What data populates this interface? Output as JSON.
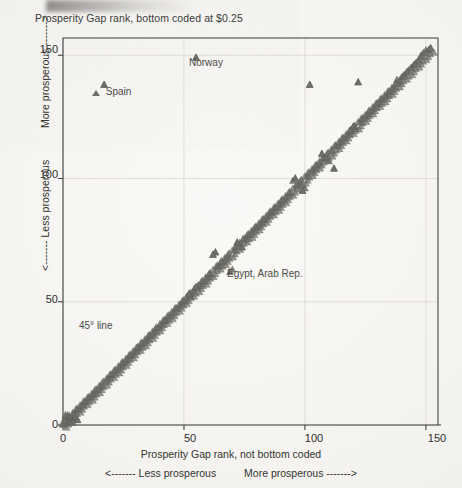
{
  "chart_data": {
    "type": "scatter",
    "title": "Prosperity Gap rank, bottom coded at $0.25",
    "xlabel": "Prosperity Gap rank, not bottom coded",
    "ylabel": "Prosperity Gap rank, bottom coded at $0.25",
    "xlim": [
      0,
      155
    ],
    "ylim": [
      0,
      157
    ],
    "xticks": [
      0,
      50,
      100,
      150
    ],
    "yticks": [
      0,
      50,
      100,
      150
    ],
    "xtick_labels": [
      "0",
      "50",
      "100",
      "150"
    ],
    "ytick_labels": [
      "0",
      "50",
      "100",
      "150"
    ],
    "grid": true,
    "grid_note": "faint light-grey gridlines at each labeled tick",
    "legend": null,
    "marker": "triangle-up",
    "marker_color": "#6e6e6a",
    "reference_line": {
      "name": "45 degree line",
      "label": "45° line",
      "from": [
        0,
        0
      ],
      "to": [
        152,
        152
      ],
      "color": "#8a8a86"
    },
    "x_direction_axis": {
      "left_text": "<------- Less prosperous",
      "right_text": "More prosperous ------->"
    },
    "y_direction_axis": {
      "low_text": "<------- Less prosperous",
      "high_text": "More prosperous ------->"
    },
    "annotations": [
      {
        "name": "norway",
        "label": "Norway",
        "x": 55,
        "y": 149,
        "label_dx": 6,
        "label_dy": -14
      },
      {
        "name": "spain",
        "label": "Spain",
        "x": 17,
        "y": 138,
        "label_dx": 13,
        "label_dy": 0
      },
      {
        "name": "egypt-arab-rep",
        "label": "Egypt, Arab Rep.",
        "x": 55,
        "y": 56,
        "label_dx": 10,
        "label_dy": -20
      },
      {
        "name": "45-degree-line",
        "label": "45° line",
        "x": 22,
        "y": 45,
        "label_dx": 0,
        "label_dy": 0
      }
    ],
    "outliers": [
      {
        "x": 55,
        "y": 149
      },
      {
        "x": 17,
        "y": 138
      },
      {
        "x": 102,
        "y": 138
      },
      {
        "x": 122,
        "y": 139
      },
      {
        "x": 63,
        "y": 70
      },
      {
        "x": 62,
        "y": 69
      },
      {
        "x": 55,
        "y": 56
      },
      {
        "x": 52,
        "y": 53
      },
      {
        "x": 72,
        "y": 74
      },
      {
        "x": 96,
        "y": 100
      },
      {
        "x": 99,
        "y": 95
      },
      {
        "x": 107,
        "y": 110
      },
      {
        "x": 112,
        "y": 104
      },
      {
        "x": 120,
        "y": 121
      },
      {
        "x": 4,
        "y": 1
      },
      {
        "x": 1,
        "y": 4
      },
      {
        "x": 6,
        "y": 2
      }
    ],
    "points": [
      [
        0,
        0
      ],
      [
        1,
        1
      ],
      [
        1,
        3
      ],
      [
        2,
        2
      ],
      [
        2,
        4
      ],
      [
        3,
        1
      ],
      [
        3,
        3
      ],
      [
        4,
        4
      ],
      [
        4,
        2
      ],
      [
        5,
        5
      ],
      [
        5,
        3
      ],
      [
        6,
        6
      ],
      [
        6,
        2
      ],
      [
        7,
        7
      ],
      [
        8,
        8
      ],
      [
        9,
        9
      ],
      [
        10,
        10
      ],
      [
        11,
        11
      ],
      [
        12,
        12
      ],
      [
        13,
        13
      ],
      [
        14,
        14
      ],
      [
        15,
        15
      ],
      [
        16,
        16
      ],
      [
        17,
        138
      ],
      [
        18,
        18
      ],
      [
        19,
        19
      ],
      [
        20,
        20
      ],
      [
        21,
        21
      ],
      [
        22,
        22
      ],
      [
        23,
        23
      ],
      [
        24,
        24
      ],
      [
        25,
        25
      ],
      [
        26,
        26
      ],
      [
        27,
        27
      ],
      [
        28,
        28
      ],
      [
        29,
        29
      ],
      [
        30,
        30
      ],
      [
        31,
        31
      ],
      [
        32,
        32
      ],
      [
        33,
        33
      ],
      [
        34,
        34
      ],
      [
        35,
        35
      ],
      [
        36,
        36
      ],
      [
        37,
        37
      ],
      [
        38,
        38
      ],
      [
        39,
        39
      ],
      [
        40,
        40
      ],
      [
        41,
        41
      ],
      [
        42,
        42
      ],
      [
        43,
        43
      ],
      [
        44,
        44
      ],
      [
        45,
        45
      ],
      [
        46,
        46
      ],
      [
        47,
        47
      ],
      [
        48,
        48
      ],
      [
        49,
        49
      ],
      [
        50,
        50
      ],
      [
        51,
        51
      ],
      [
        52,
        53
      ],
      [
        53,
        52
      ],
      [
        54,
        54
      ],
      [
        55,
        149
      ],
      [
        56,
        56
      ],
      [
        57,
        57
      ],
      [
        58,
        58
      ],
      [
        59,
        59
      ],
      [
        60,
        60
      ],
      [
        61,
        61
      ],
      [
        62,
        69
      ],
      [
        63,
        70
      ],
      [
        64,
        64
      ],
      [
        65,
        65
      ],
      [
        66,
        66
      ],
      [
        67,
        67
      ],
      [
        68,
        68
      ],
      [
        69,
        62
      ],
      [
        70,
        63
      ],
      [
        71,
        71
      ],
      [
        72,
        74
      ],
      [
        73,
        73
      ],
      [
        74,
        72
      ],
      [
        75,
        75
      ],
      [
        76,
        76
      ],
      [
        77,
        77
      ],
      [
        78,
        78
      ],
      [
        79,
        79
      ],
      [
        80,
        80
      ],
      [
        81,
        81
      ],
      [
        82,
        82
      ],
      [
        83,
        83
      ],
      [
        84,
        84
      ],
      [
        85,
        85
      ],
      [
        86,
        86
      ],
      [
        87,
        87
      ],
      [
        88,
        88
      ],
      [
        89,
        89
      ],
      [
        90,
        90
      ],
      [
        91,
        91
      ],
      [
        92,
        92
      ],
      [
        93,
        93
      ],
      [
        94,
        94
      ],
      [
        95,
        99
      ],
      [
        96,
        100
      ],
      [
        97,
        97
      ],
      [
        98,
        98
      ],
      [
        99,
        95
      ],
      [
        100,
        96
      ],
      [
        101,
        101
      ],
      [
        102,
        138
      ],
      [
        103,
        103
      ],
      [
        104,
        104
      ],
      [
        105,
        105
      ],
      [
        106,
        106
      ],
      [
        107,
        110
      ],
      [
        108,
        108
      ],
      [
        109,
        109
      ],
      [
        110,
        107
      ],
      [
        111,
        111
      ],
      [
        112,
        104
      ],
      [
        113,
        113
      ],
      [
        114,
        114
      ],
      [
        115,
        115
      ],
      [
        116,
        116
      ],
      [
        117,
        117
      ],
      [
        118,
        118
      ],
      [
        119,
        119
      ],
      [
        120,
        121
      ],
      [
        121,
        120
      ],
      [
        122,
        139
      ],
      [
        123,
        123
      ],
      [
        124,
        124
      ],
      [
        125,
        125
      ],
      [
        126,
        126
      ],
      [
        127,
        127
      ],
      [
        128,
        128
      ],
      [
        129,
        129
      ],
      [
        130,
        130
      ],
      [
        131,
        131
      ],
      [
        132,
        132
      ],
      [
        133,
        133
      ],
      [
        134,
        134
      ],
      [
        135,
        135
      ],
      [
        136,
        136
      ],
      [
        137,
        137
      ],
      [
        138,
        140
      ],
      [
        139,
        139
      ],
      [
        140,
        141
      ],
      [
        141,
        142
      ],
      [
        142,
        143
      ],
      [
        143,
        144
      ],
      [
        144,
        145
      ],
      [
        145,
        146
      ],
      [
        146,
        147
      ],
      [
        147,
        148
      ],
      [
        148,
        150
      ],
      [
        149,
        151
      ],
      [
        150,
        152
      ],
      [
        151,
        152
      ],
      [
        152,
        153
      ]
    ]
  },
  "axes": {
    "x_title": "Prosperity Gap rank, not bottom coded",
    "y_title": "Prosperity Gap rank, bottom coded at $0.25",
    "x_dir_left": "<------- Less prosperous",
    "x_dir_right": "More prosperous ------->",
    "y_dir_low": "<------- Less prosperous",
    "y_dir_high": "More prosperous ------->"
  },
  "ticks": {
    "x": [
      "0",
      "50",
      "100",
      "150"
    ],
    "y": [
      "0",
      "50",
      "100",
      "150"
    ]
  },
  "annotation_labels": {
    "norway": "Norway",
    "spain": "Spain",
    "egypt": "Egypt, Arab Rep.",
    "line45": "45° line"
  },
  "colors": {
    "marker": "#6e6e6a",
    "reference_line": "#8a8a86",
    "axis": "#3b3b38",
    "grid": "#dcdad6",
    "paper": "#f4f2ef",
    "text": "#2e2e2c"
  }
}
